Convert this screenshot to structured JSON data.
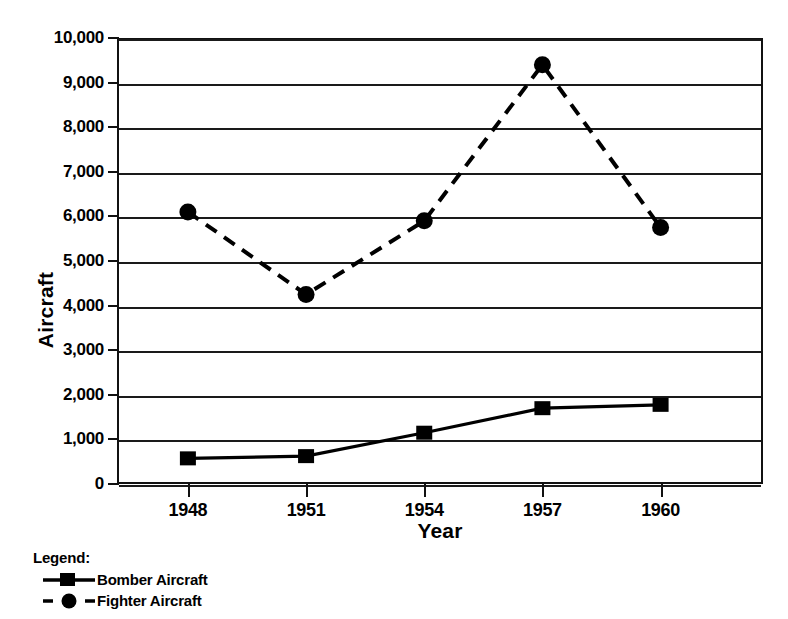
{
  "chart_data": {
    "type": "line",
    "title": "",
    "xlabel": "Year",
    "ylabel": "Aircraft",
    "x": [
      1948,
      1951,
      1954,
      1957,
      1960
    ],
    "categories": [
      "1948",
      "1951",
      "1954",
      "1957",
      "1960"
    ],
    "series": [
      {
        "name": "Bomber Aircraft",
        "values": [
          575,
          625,
          1150,
          1700,
          1775
        ],
        "line_style": "solid",
        "marker": "square",
        "color": "#000000"
      },
      {
        "name": "Fighter Aircraft",
        "values": [
          6100,
          4250,
          5900,
          9400,
          5750
        ],
        "line_style": "dashed",
        "marker": "circle",
        "color": "#000000"
      }
    ],
    "ylim": [
      0,
      10000
    ],
    "xlim": [
      1946.2,
      1962.6
    ],
    "ytick_values": [
      0,
      1000,
      2000,
      3000,
      4000,
      5000,
      6000,
      7000,
      8000,
      9000,
      10000
    ],
    "ytick_labels": [
      "0",
      "1,000",
      "2,000",
      "3,000",
      "4,000",
      "5,000",
      "6,000",
      "7,000",
      "8,000",
      "9,000",
      "10,000"
    ],
    "xtick_labels": [
      "1948",
      "1951",
      "1954",
      "1957",
      "1960"
    ],
    "grid": "horizontal",
    "legend_position": "below-left"
  },
  "legend": {
    "heading": "Legend:",
    "entries": [
      {
        "label": "Bomber Aircraft",
        "marker": "square-marker",
        "line": "solid"
      },
      {
        "label": "Fighter Aircraft",
        "marker": "circle-marker",
        "line": "dashed"
      }
    ]
  },
  "axes": {
    "y_title": "Aircraft",
    "x_title": "Year"
  }
}
